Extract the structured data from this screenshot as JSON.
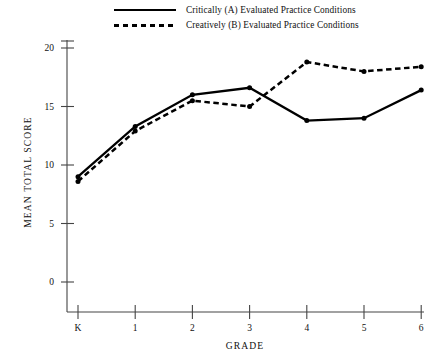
{
  "chart_data": {
    "type": "line",
    "title": "",
    "xlabel": "GRADE",
    "ylabel": "MEAN TOTAL SCORE",
    "categories": [
      "K",
      "1",
      "2",
      "3",
      "4",
      "5",
      "6"
    ],
    "xticklabels": [
      "K",
      "1",
      "2",
      "3",
      "4",
      "5",
      "6"
    ],
    "yticklabels": [
      "0",
      "5",
      "10",
      "15",
      "20"
    ],
    "yticks": [
      0,
      5,
      10,
      15,
      20
    ],
    "ylim": [
      0,
      20
    ],
    "grid": false,
    "legend_position": "top",
    "series": [
      {
        "name": "Critically (A) Evaluated Practice Conditions",
        "style": "solid",
        "key": "solid-line-key",
        "values": [
          9.0,
          13.3,
          16.0,
          16.6,
          13.8,
          14.0,
          16.4
        ]
      },
      {
        "name": "Creatively (B) Evaluated Practice Conditions",
        "style": "dashed",
        "key": "dashed-line-key",
        "values": [
          8.6,
          12.9,
          15.5,
          15.0,
          18.8,
          18.0,
          18.4
        ]
      }
    ]
  }
}
